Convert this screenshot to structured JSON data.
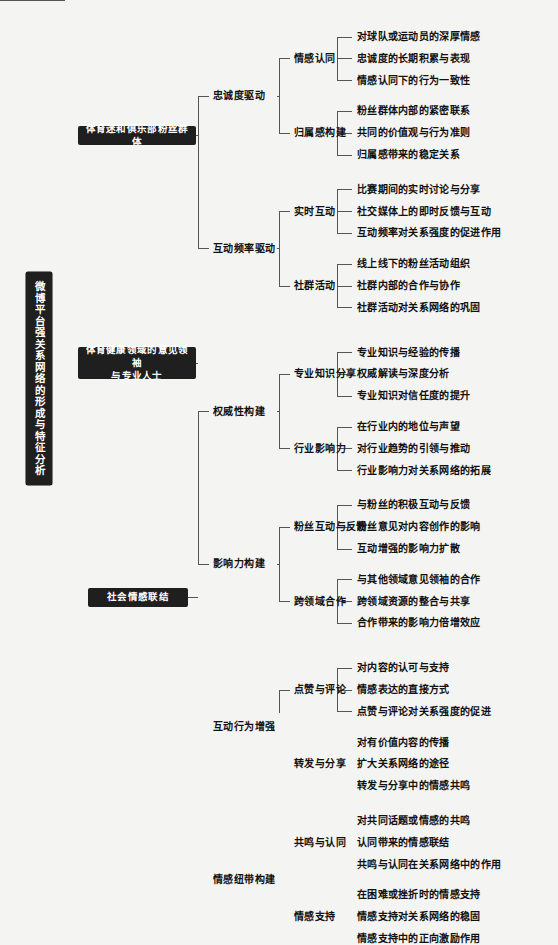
{
  "diagram": {
    "type": "mind-map",
    "title": "微博平台强关系网络的形成与特征分析",
    "background_color": "#f4f4f2",
    "node_color": "#201f1f",
    "node_text_color": "#ffffff",
    "line_color": "#555555",
    "root": {
      "label": "微博平台强关系网络的形成与特征分析",
      "orientation": "vertical"
    },
    "branches": [
      {
        "label": "体育迷和俱乐部粉丝群体",
        "children": [
          {
            "label": "忠诚度驱动",
            "children": [
              {
                "label": "情感认同",
                "leaves": [
                  "对球队或运动员的深厚情感",
                  "忠诚度的长期积累与表现",
                  "情感认同下的行为一致性"
                ]
              },
              {
                "label": "归属感构建",
                "leaves": [
                  "粉丝群体内部的紧密联系",
                  "共同的价值观与行为准则",
                  "归属感带来的稳定关系"
                ]
              }
            ]
          },
          {
            "label": "互动频率驱动",
            "children": [
              {
                "label": "实时互动",
                "leaves": [
                  "比赛期间的实时讨论与分享",
                  "社交媒体上的即时反馈与互动",
                  "互动频率对关系强度的促进作用"
                ]
              },
              {
                "label": "社群活动",
                "leaves": [
                  "线上线下的粉丝活动组织",
                  "社群内部的合作与协作",
                  "社群活动对关系网络的巩固"
                ]
              }
            ]
          }
        ]
      },
      {
        "label": "体育健康领域的意见领袖与专业人士",
        "label_lines": [
          "体育健康领域的意见领袖",
          "与专业人士"
        ],
        "children": [
          {
            "label": "权威性构建",
            "children": [
              {
                "label": "专业知识分享",
                "leaves": [
                  "专业知识与经验的传播",
                  "权威解读与深度分析",
                  "专业知识对信任度的提升"
                ]
              },
              {
                "label": "行业影响力",
                "leaves": [
                  "在行业内的地位与声望",
                  "对行业趋势的引领与推动",
                  "行业影响力对关系网络的拓展"
                ]
              }
            ]
          },
          {
            "label": "影响力构建",
            "children": [
              {
                "label": "粉丝互动与反馈",
                "leaves": [
                  "与粉丝的积极互动与反馈",
                  "粉丝意见对内容创作的影响",
                  "互动增强的影响力扩散"
                ]
              },
              {
                "label": "跨领域合作",
                "leaves": [
                  "与其他领域意见领袖的合作",
                  "跨领域资源的整合与共享",
                  "合作带来的影响力倍增效应"
                ]
              }
            ]
          }
        ]
      },
      {
        "label": "社会情感联结",
        "children": [
          {
            "label": "互动行为增强",
            "children": [
              {
                "label": "点赞与评论",
                "leaves": [
                  "对内容的认可与支持",
                  "情感表达的直接方式",
                  "点赞与评论对关系强度的促进"
                ]
              },
              {
                "label": "转发与分享",
                "leaves": [
                  "对有价值内容的传播",
                  "扩大关系网络的途径",
                  "转发与分享中的情感共鸣"
                ]
              }
            ]
          },
          {
            "label": "情感纽带构建",
            "children": [
              {
                "label": "共鸣与认同",
                "leaves": [
                  "对共同话题或情感的共鸣",
                  "认同带来的情感联结",
                  "共鸣与认同在关系网络中的作用"
                ]
              },
              {
                "label": "情感支持",
                "leaves": [
                  "在困难或挫折时的情感支持",
                  "情感支持对关系网络的稳固",
                  "情感支持中的正向激励作用"
                ]
              }
            ]
          }
        ]
      }
    ]
  }
}
